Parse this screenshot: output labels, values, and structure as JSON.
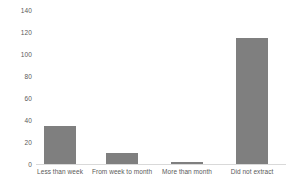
{
  "chart_data": {
    "type": "bar",
    "title": "",
    "subtitle": "",
    "xlabel": "",
    "ylabel": "",
    "categories": [
      "Less than week",
      "From week to month",
      "More than month",
      "Did not extract"
    ],
    "values": [
      35,
      10,
      2,
      115
    ],
    "ylim": [
      0,
      140
    ],
    "ytick_step": 20,
    "yticks": [
      0,
      20,
      40,
      60,
      80,
      100,
      120,
      140
    ],
    "ytick_labels": [
      "0",
      "20",
      "40",
      "60",
      "80",
      "100",
      "120",
      "140"
    ],
    "grid": false,
    "legend": null,
    "legend_position": "none",
    "annotations": [],
    "colors": {
      "bar_fill": "#7f7f7f",
      "axis_text": "#595959",
      "baseline": "#d9d9d9",
      "background": "#ffffff"
    }
  }
}
